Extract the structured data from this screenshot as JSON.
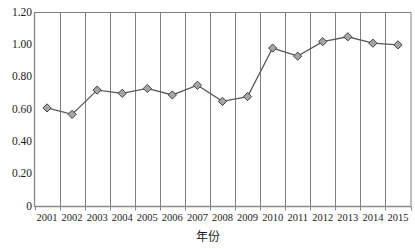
{
  "chart_data": {
    "type": "line",
    "title": "",
    "xlabel": "年份",
    "ylabel": "",
    "categories": [
      "2001",
      "2002",
      "2003",
      "2004",
      "2005",
      "2006",
      "2007",
      "2008",
      "2009",
      "2010",
      "2011",
      "2012",
      "2013",
      "2014",
      "2015"
    ],
    "values": [
      0.61,
      0.57,
      0.72,
      0.7,
      0.73,
      0.69,
      0.75,
      0.65,
      0.68,
      0.98,
      0.93,
      1.02,
      1.05,
      1.01,
      1.0
    ],
    "series": [
      {
        "name": "",
        "values": [
          0.61,
          0.57,
          0.72,
          0.7,
          0.73,
          0.69,
          0.75,
          0.65,
          0.68,
          0.98,
          0.93,
          1.02,
          1.05,
          1.01,
          1.0
        ]
      }
    ],
    "ylim": [
      0,
      1.2
    ],
    "ytick_labels": [
      "1.20",
      "1.00",
      "0.80",
      "0.60",
      "0.40",
      "0.20",
      "0"
    ],
    "ytick_values": [
      1.2,
      1.0,
      0.8,
      0.6,
      0.4,
      0.2,
      0
    ],
    "grid": "vertical-only",
    "legend": "none",
    "marker": "diamond",
    "line_color": "#595959",
    "marker_fill": "#a6a6a6",
    "marker_stroke": "#404040",
    "grid_color": "#808080",
    "axis_color": "#808080"
  },
  "axes": {
    "x_title": "年份"
  },
  "labels": {
    "y": [
      "1.20",
      "1.00",
      "0.80",
      "0.60",
      "0.40",
      "0.20",
      "0"
    ],
    "x": [
      "2001",
      "2002",
      "2003",
      "2004",
      "2005",
      "2006",
      "2007",
      "2008",
      "2009",
      "2010",
      "2011",
      "2012",
      "2013",
      "2014",
      "2015"
    ]
  }
}
